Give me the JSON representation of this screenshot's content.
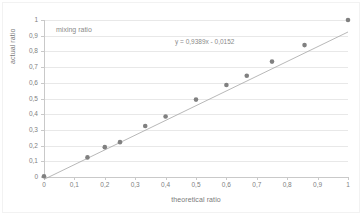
{
  "chart_data": {
    "type": "scatter",
    "title": "mixing ratio",
    "xlabel": "theoretical ratio",
    "ylabel": "actual ratio",
    "xlim": [
      0,
      1
    ],
    "ylim": [
      0,
      1
    ],
    "grid": true,
    "legend": "none",
    "xticks": [
      "0",
      "0,1",
      "0,2",
      "0,3",
      "0,4",
      "0,5",
      "0,6",
      "0,7",
      "0,8",
      "0,9",
      "1"
    ],
    "xtick_values": [
      0,
      0.1,
      0.2,
      0.3,
      0.4,
      0.5,
      0.6,
      0.7,
      0.8,
      0.9,
      1
    ],
    "yticks": [
      "0",
      "0,1",
      "0,2",
      "0,3",
      "0,4",
      "0,5",
      "0,6",
      "0,7",
      "0,8",
      "0,9",
      "1"
    ],
    "ytick_values": [
      0,
      0.1,
      0.2,
      0.3,
      0.4,
      0.5,
      0.6,
      0.7,
      0.8,
      0.9,
      1
    ],
    "trendline": {
      "equation": "y = 0,9389x - 0,0152",
      "slope": 0.9389,
      "intercept": -0.0152,
      "color": "#a6a6a6"
    },
    "marker_color": "#808080",
    "points": [
      {
        "x": 0.0,
        "y": 0.005
      },
      {
        "x": 0.143,
        "y": 0.125
      },
      {
        "x": 0.2,
        "y": 0.19
      },
      {
        "x": 0.25,
        "y": 0.222
      },
      {
        "x": 0.333,
        "y": 0.325
      },
      {
        "x": 0.4,
        "y": 0.385
      },
      {
        "x": 0.5,
        "y": 0.493
      },
      {
        "x": 0.6,
        "y": 0.586
      },
      {
        "x": 0.667,
        "y": 0.645
      },
      {
        "x": 0.75,
        "y": 0.735
      },
      {
        "x": 0.857,
        "y": 0.84
      },
      {
        "x": 1.0,
        "y": 1.0
      }
    ],
    "annotations": [
      {
        "text": "mixing ratio",
        "x": 0.04,
        "y": 0.96
      },
      {
        "text": "y = 0,9389x - 0,0152",
        "x": 0.43,
        "y": 0.89
      }
    ]
  }
}
